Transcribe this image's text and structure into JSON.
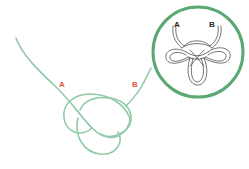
{
  "diagram": {
    "type": "knot-illustration",
    "colors": {
      "strand": "#7cc29a",
      "circle_border": "#5aa874",
      "inset_line": "#3a3a3a",
      "label_red": "#e0573f",
      "label_dark": "#2a2a2a"
    },
    "main_labels": {
      "a": "A",
      "b": "B"
    },
    "inset": {
      "labels": {
        "a": "A",
        "b": "B"
      }
    }
  }
}
